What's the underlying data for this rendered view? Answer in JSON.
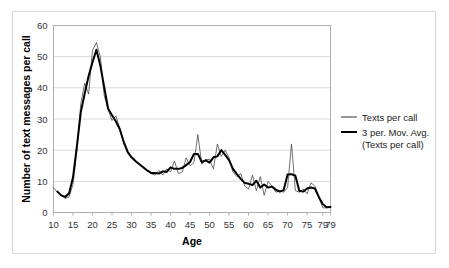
{
  "chart_data": {
    "type": "line",
    "title": "",
    "xlabel": "Age",
    "ylabel": "Number of text messages per call",
    "xlim": [
      10,
      81
    ],
    "ylim": [
      0,
      60
    ],
    "yticks": [
      0,
      10,
      20,
      30,
      40,
      50,
      60
    ],
    "ytick_labels": [
      "0",
      "10",
      "20",
      "30",
      "40",
      "50",
      "60"
    ],
    "xticks": [
      10,
      15,
      20,
      25,
      30,
      35,
      40,
      45,
      50,
      55,
      60,
      65,
      70,
      75,
      79,
      81
    ],
    "xtick_labels": [
      "10",
      "15",
      "20",
      "25",
      "30",
      "35",
      "40",
      "45",
      "50",
      "55",
      "60",
      "65",
      "70",
      "75",
      "79",
      "79"
    ],
    "grid": "horizontal",
    "legend_position": "right",
    "x": [
      10,
      11,
      12,
      13,
      14,
      15,
      16,
      17,
      18,
      19,
      20,
      21,
      22,
      23,
      24,
      25,
      26,
      27,
      28,
      29,
      30,
      31,
      32,
      33,
      34,
      35,
      36,
      37,
      38,
      39,
      40,
      41,
      42,
      43,
      44,
      45,
      46,
      47,
      48,
      49,
      50,
      51,
      52,
      53,
      54,
      55,
      56,
      57,
      58,
      59,
      60,
      61,
      62,
      63,
      64,
      65,
      66,
      67,
      68,
      69,
      70,
      71,
      72,
      73,
      74,
      75,
      76,
      77,
      78,
      79,
      80,
      81
    ],
    "series": [
      {
        "name": "Texts per call",
        "style": "thin",
        "color": "#333333",
        "width": 0.7,
        "values": [
          8.0,
          6.5,
          5.5,
          4.5,
          5.0,
          9.0,
          20.0,
          35.0,
          41.5,
          38.0,
          52.0,
          54.5,
          50.0,
          37.5,
          33.0,
          29.5,
          31.0,
          27.0,
          22.0,
          19.0,
          17.5,
          16.5,
          15.5,
          14.5,
          13.5,
          12.5,
          12.0,
          13.5,
          12.0,
          14.0,
          13.0,
          16.5,
          12.5,
          13.0,
          17.5,
          15.0,
          16.0,
          25.0,
          15.5,
          17.0,
          17.0,
          14.0,
          22.0,
          18.0,
          20.0,
          17.5,
          13.0,
          11.5,
          12.5,
          8.5,
          7.5,
          12.0,
          7.0,
          11.5,
          5.5,
          10.0,
          8.5,
          6.5,
          7.0,
          6.5,
          8.0,
          22.0,
          7.0,
          6.5,
          7.5,
          6.0,
          9.5,
          8.5,
          5.0,
          1.5,
          1.5,
          2.0
        ]
      },
      {
        "name": "3 per. Mov. Avg. (Texts per call)",
        "style": "thick",
        "color": "#000000",
        "width": 2.0,
        "values": [
          null,
          6.7,
          5.5,
          5.0,
          6.2,
          11.3,
          21.3,
          32.2,
          38.2,
          43.8,
          48.2,
          52.2,
          47.2,
          40.2,
          33.3,
          31.2,
          29.2,
          26.7,
          22.7,
          19.5,
          17.7,
          16.5,
          15.5,
          14.5,
          13.5,
          12.7,
          12.7,
          12.5,
          13.2,
          13.0,
          14.5,
          14.0,
          14.0,
          14.3,
          15.2,
          16.2,
          18.8,
          18.8,
          16.2,
          16.7,
          16.0,
          17.7,
          18.0,
          20.0,
          18.5,
          16.8,
          14.0,
          12.3,
          10.8,
          9.5,
          9.2,
          8.8,
          10.2,
          8.0,
          9.0,
          8.0,
          8.3,
          7.3,
          6.7,
          7.2,
          12.2,
          12.3,
          11.8,
          7.0,
          6.7,
          7.7,
          8.0,
          7.7,
          5.0,
          2.7,
          1.7,
          1.8
        ]
      }
    ]
  },
  "legend": {
    "entries": [
      {
        "label": "Texts per call",
        "line": "thin"
      },
      {
        "label": "3 per. Mov. Avg.",
        "label2": "(Texts per call)",
        "line": "thick"
      }
    ]
  },
  "colors": {
    "grid": "#d9d9d9",
    "axis": "#b0b0b0",
    "frame": "#d8d8d8",
    "text": "#333333",
    "series_thin": "#333333",
    "series_thick": "#000000"
  }
}
